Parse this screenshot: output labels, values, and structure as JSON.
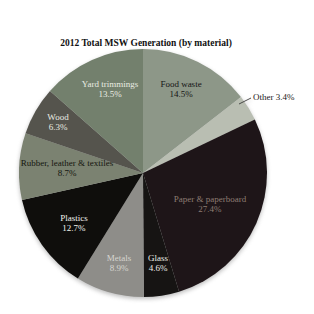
{
  "title": {
    "line1": "2012 Total MSW Generation (by material)",
    "line2": "251 Million Tons (before  recycling)"
  },
  "chart_data": {
    "type": "pie",
    "title": "2012 Total MSW Generation (by material)",
    "subtitle": "251 Million Tons (before  recycling)",
    "categories": [
      "Food waste",
      "Other",
      "Paper & paperboard",
      "Glass",
      "Metals",
      "Plastics",
      "Rubber, leather & textiles",
      "Wood",
      "Yard trimmings"
    ],
    "values": [
      14.5,
      3.4,
      27.4,
      4.6,
      8.9,
      12.7,
      8.7,
      6.3,
      13.5
    ],
    "slices": [
      {
        "id": "food-waste",
        "label": "Food waste",
        "pct": 14.5,
        "pct_label": "14.5%",
        "color": "#8d9788",
        "text_color": "#151515",
        "label_pos": [
          181,
          89
        ]
      },
      {
        "id": "other",
        "label": "Other",
        "pct": 3.4,
        "pct_label": "3.4%",
        "color": "#b9beb2",
        "text_color": "#1a1a1a",
        "label_pos": [
          253,
          97
        ],
        "external": true
      },
      {
        "id": "paper-paperboard",
        "label": "Paper & paperboard",
        "pct": 27.4,
        "pct_label": "27.4%",
        "color": "#1e1518",
        "text_color": "#8d7c72",
        "label_pos": [
          210,
          204
        ]
      },
      {
        "id": "glass",
        "label": "Glass",
        "pct": 4.6,
        "pct_label": "4.6%",
        "color": "#161413",
        "text_color": "#ecece6",
        "label_pos": [
          158,
          263
        ]
      },
      {
        "id": "metals",
        "label": "Metals",
        "pct": 8.9,
        "pct_label": "8.9%",
        "color": "#8e8d89",
        "text_color": "#d6d6d0",
        "label_pos": [
          119,
          263
        ]
      },
      {
        "id": "plastics",
        "label": "Plastics",
        "pct": 12.7,
        "pct_label": "12.7%",
        "color": "#0f0e0c",
        "text_color": "#f2f2ee",
        "label_pos": [
          74,
          223
        ]
      },
      {
        "id": "rubber-leather-textiles",
        "label": "Rubber, leather & textiles",
        "pct": 8.7,
        "pct_label": "8.7%",
        "color": "#7b8271",
        "text_color": "#14160f",
        "label_pos": [
          67,
          168
        ]
      },
      {
        "id": "wood",
        "label": "Wood",
        "pct": 6.3,
        "pct_label": "6.3%",
        "color": "#55544d",
        "text_color": "#e9ebe3",
        "label_pos": [
          58,
          122
        ]
      },
      {
        "id": "yard-trimmings",
        "label": "Yard trimmings",
        "pct": 13.5,
        "pct_label": "13.5%",
        "color": "#73806d",
        "text_color": "#e9ece2",
        "label_pos": [
          110,
          89
        ]
      }
    ],
    "layout": {
      "cx": 143,
      "cy": 173,
      "r": 124,
      "start_angle_deg": 0,
      "clockwise": true,
      "legend": "none",
      "grid": false,
      "leader_line": {
        "x1": 239,
        "y1": 104,
        "x2": 251,
        "y2": 98,
        "color": "#3a3a3a"
      }
    }
  }
}
